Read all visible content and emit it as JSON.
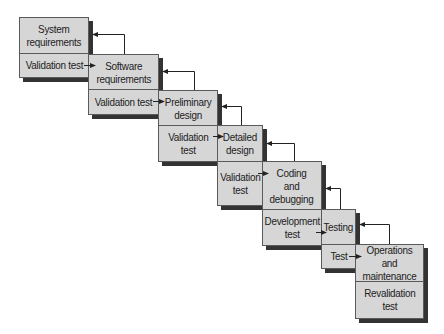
{
  "diagram": {
    "title": "",
    "type": "waterfall-model",
    "colors": {
      "box_fill": "#d6d6d6",
      "box_border": "#5a5a5a",
      "shadow": "#333333",
      "line": "#222222"
    },
    "stages": [
      {
        "name": "System requirements",
        "label": "System\nrequirements",
        "validation": "Validation test"
      },
      {
        "name": "Software requirements",
        "label": "Software\nrequirements",
        "validation": "Validation test"
      },
      {
        "name": "Preliminary design",
        "label": "Preliminary\ndesign",
        "validation": "Validation\ntest"
      },
      {
        "name": "Detailed design",
        "label": "Detailed\ndesign",
        "validation": "Validation\ntest"
      },
      {
        "name": "Coding and debugging",
        "label": "Coding\nand\ndebugging",
        "validation": "Development\ntest"
      },
      {
        "name": "Testing",
        "label": "Testing",
        "validation": "Test"
      },
      {
        "name": "Operations and maintenance",
        "label": "Operations and\nmaintenance",
        "validation": "Revalidation\ntest"
      }
    ],
    "connections": [
      {
        "from": "System requirements (Validation test)",
        "to": "Software requirements",
        "kind": "forward"
      },
      {
        "from": "Software requirements",
        "to": "System requirements",
        "kind": "feedback"
      },
      {
        "from": "Software requirements (Validation test)",
        "to": "Preliminary design",
        "kind": "forward"
      },
      {
        "from": "Preliminary design",
        "to": "Software requirements",
        "kind": "feedback"
      },
      {
        "from": "Preliminary design (Validation test)",
        "to": "Detailed design",
        "kind": "forward"
      },
      {
        "from": "Detailed design",
        "to": "Preliminary design",
        "kind": "feedback"
      },
      {
        "from": "Detailed design (Validation test)",
        "to": "Coding and debugging",
        "kind": "forward"
      },
      {
        "from": "Coding and debugging",
        "to": "Detailed design",
        "kind": "feedback"
      },
      {
        "from": "Coding and debugging (Development test)",
        "to": "Testing",
        "kind": "forward"
      },
      {
        "from": "Testing",
        "to": "Coding and debugging",
        "kind": "feedback"
      },
      {
        "from": "Testing (Test)",
        "to": "Operations and maintenance",
        "kind": "forward"
      },
      {
        "from": "Operations and maintenance",
        "to": "Testing",
        "kind": "feedback"
      }
    ]
  }
}
